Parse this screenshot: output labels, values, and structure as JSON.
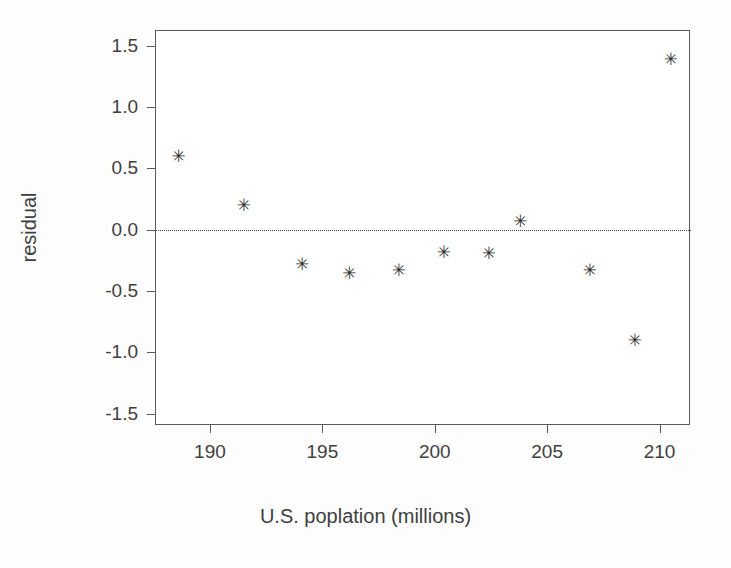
{
  "chart_data": {
    "type": "scatter",
    "title": "",
    "xlabel": "U.S. poplation (millions)",
    "ylabel": "residual",
    "xlim": [
      187.6,
      211.4
    ],
    "ylim": [
      -1.6,
      1.62
    ],
    "grid": false,
    "legend": null,
    "marker": "asterisk",
    "marker_color": "#2e2e2e",
    "reference_lines": [
      {
        "name": "zero-line",
        "orientation": "horizontal",
        "y": 0.0,
        "style": "dotted",
        "color": "#4a4a4a"
      }
    ],
    "xticks": [
      190,
      195,
      200,
      205,
      210
    ],
    "xtick_labels": [
      "190",
      "195",
      "200",
      "205",
      "210"
    ],
    "yticks": [
      1.5,
      1.0,
      0.5,
      0.0,
      -0.5,
      -1.0,
      -1.5
    ],
    "ytick_labels": [
      "1.5",
      "1.0",
      "0.5",
      "0.0",
      "-0.5",
      "-1.0",
      "-1.5"
    ],
    "x": [
      188.6,
      191.5,
      194.1,
      196.2,
      198.4,
      200.4,
      202.4,
      203.8,
      206.9,
      208.9,
      210.5
    ],
    "y": [
      0.6,
      0.2,
      -0.28,
      -0.35,
      -0.33,
      -0.18,
      -0.19,
      0.07,
      -0.33,
      -0.9,
      1.39
    ],
    "points": [
      {
        "x": 188.6,
        "y": 0.6
      },
      {
        "x": 191.5,
        "y": 0.2
      },
      {
        "x": 194.1,
        "y": -0.28
      },
      {
        "x": 196.2,
        "y": -0.35
      },
      {
        "x": 198.4,
        "y": -0.33
      },
      {
        "x": 200.4,
        "y": -0.18
      },
      {
        "x": 202.4,
        "y": -0.19
      },
      {
        "x": 203.8,
        "y": 0.07
      },
      {
        "x": 206.9,
        "y": -0.33
      },
      {
        "x": 208.9,
        "y": -0.9
      },
      {
        "x": 210.5,
        "y": 1.39
      }
    ],
    "marker_glyph": "✳"
  }
}
